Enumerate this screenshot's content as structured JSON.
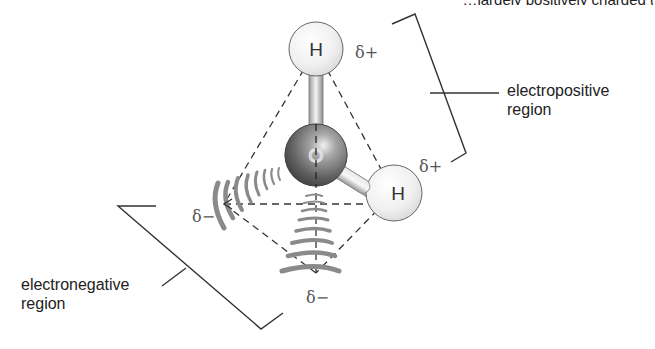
{
  "header": {
    "cut_text": "…largely positively charged ("
  },
  "molecule": {
    "name": "water",
    "atoms": [
      {
        "id": "h-top",
        "symbol": "H",
        "charge": "δ+"
      },
      {
        "id": "o-center",
        "symbol": "O"
      },
      {
        "id": "h-right",
        "symbol": "H",
        "charge": "δ+"
      }
    ],
    "lone_pairs": [
      {
        "id": "lp-left",
        "charge": "δ−"
      },
      {
        "id": "lp-bottom",
        "charge": "δ−"
      }
    ]
  },
  "labels": {
    "h_top": "H",
    "o": "O",
    "h_right": "H",
    "delta_plus_top": "δ+",
    "delta_plus_right": "δ+",
    "delta_minus_left": "δ−",
    "delta_minus_bottom": "δ−",
    "electropositive_line1": "electropositive",
    "electropositive_line2": "region",
    "electronegative_line1": "electronegative",
    "electronegative_line2": "region"
  },
  "colors": {
    "wave": "#8a8a8a",
    "line": "#333333",
    "oxygen": "#6e6e6e",
    "hydrogen": "#eeeeee",
    "text": "#222222"
  }
}
